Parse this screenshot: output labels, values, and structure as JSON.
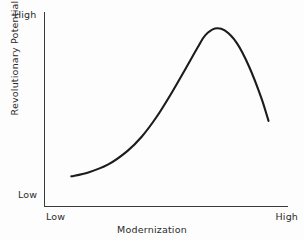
{
  "chart_data": {
    "type": "line",
    "title": "",
    "subtitle": "",
    "xlabel": "Modernization",
    "ylabel": "Revolutionary Potential",
    "x_tick_labels": [
      "Low",
      "High"
    ],
    "y_tick_labels": [
      "Low",
      "High"
    ],
    "xlim": [
      0,
      1
    ],
    "ylim": [
      0,
      1
    ],
    "grid": false,
    "legend": null,
    "annotations": [],
    "series": [
      {
        "name": "Revolutionary potential vs. modernization",
        "x": [
          0.11,
          0.18,
          0.26,
          0.34,
          0.4,
          0.46,
          0.52,
          0.58,
          0.63,
          0.66,
          0.7,
          0.74,
          0.79,
          0.84,
          0.89,
          0.92
        ],
        "y": [
          0.155,
          0.175,
          0.215,
          0.285,
          0.36,
          0.46,
          0.58,
          0.71,
          0.82,
          0.88,
          0.915,
          0.905,
          0.84,
          0.72,
          0.56,
          0.44
        ]
      }
    ]
  },
  "labels": {
    "y_high": "High",
    "y_low": "Low",
    "x_low": "Low",
    "x_high": "High",
    "x_title": "Modernization",
    "y_title": "Revolutionary Potential"
  },
  "colors": {
    "background": "#fdfdfd",
    "axis": "#3a3a3a",
    "curve": "#1c1c1c",
    "text": "#2b2b2b"
  }
}
